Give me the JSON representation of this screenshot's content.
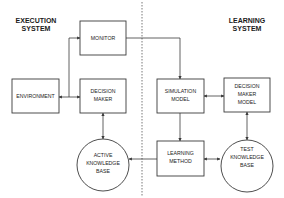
{
  "sections": {
    "execution": {
      "line1": "EXECUTION",
      "line2": "SYSTEM"
    },
    "learning": {
      "line1": "LEARNING",
      "line2": "SYSTEM"
    }
  },
  "nodes": {
    "monitor": {
      "line1": "MONITOR"
    },
    "environment": {
      "line1": "ENVIRONMENT"
    },
    "decision_maker": {
      "line1": "DECISION",
      "line2": "MAKER"
    },
    "simulation_model": {
      "line1": "SIMULATION",
      "line2": "MODEL"
    },
    "decision_maker_model": {
      "line1": "DECISION",
      "line2": "MAKER",
      "line3": "MODEL"
    },
    "active_kb": {
      "line1": "ACTIVE",
      "line2": "KNOWLEDGE",
      "line3": "BASE"
    },
    "learning_method": {
      "line1": "LEARNING",
      "line2": "METHOD"
    },
    "test_kb": {
      "line1": "TEST",
      "line2": "KNOWLEDGE",
      "line3": "BASE"
    }
  },
  "colors": {
    "stroke": "#3a3a3a",
    "text": "#1a1a1a",
    "background": "#ffffff"
  }
}
